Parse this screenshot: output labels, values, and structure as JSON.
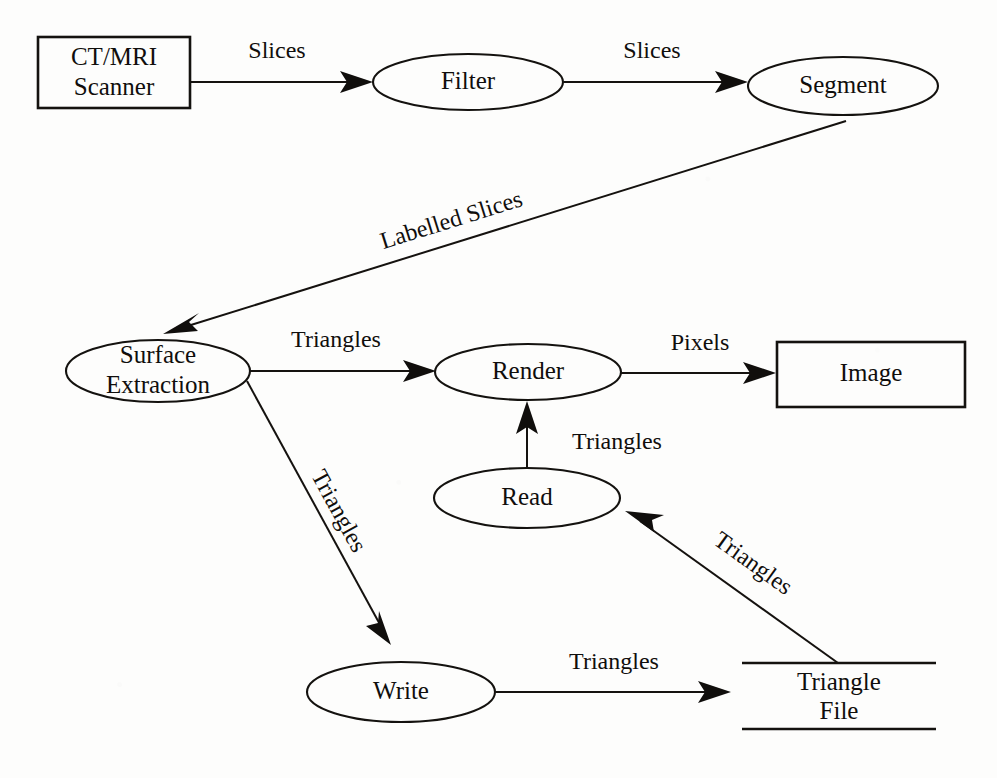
{
  "diagram": {
    "type": "dataflow-diagram",
    "background_color": "#fdfdfc",
    "stroke_color": "#14120f",
    "nodes": [
      {
        "id": "scanner",
        "label_lines": [
          "CT/MRI",
          "Scanner"
        ],
        "line1": "CT/MRI",
        "line2": "Scanner",
        "shape": "rectangle"
      },
      {
        "id": "filter",
        "label_lines": [
          "Filter"
        ],
        "line1": "Filter",
        "shape": "ellipse"
      },
      {
        "id": "segment",
        "label_lines": [
          "Segment"
        ],
        "line1": "Segment",
        "shape": "ellipse"
      },
      {
        "id": "surface-extraction",
        "label_lines": [
          "Surface",
          "Extraction"
        ],
        "line1": "Surface",
        "line2": "Extraction",
        "shape": "ellipse"
      },
      {
        "id": "render",
        "label_lines": [
          "Render"
        ],
        "line1": "Render",
        "shape": "ellipse"
      },
      {
        "id": "image",
        "label_lines": [
          "Image"
        ],
        "line1": "Image",
        "shape": "rectangle"
      },
      {
        "id": "read",
        "label_lines": [
          "Read"
        ],
        "line1": "Read",
        "shape": "ellipse"
      },
      {
        "id": "write",
        "label_lines": [
          "Write"
        ],
        "line1": "Write",
        "shape": "ellipse"
      },
      {
        "id": "triangle-file",
        "label_lines": [
          "Triangle",
          "File"
        ],
        "line1": "Triangle",
        "line2": "File",
        "shape": "data-store"
      }
    ],
    "edges": [
      {
        "id": "scanner-to-filter",
        "from": "scanner",
        "to": "filter",
        "label": "Slices"
      },
      {
        "id": "filter-to-segment",
        "from": "filter",
        "to": "segment",
        "label": "Slices"
      },
      {
        "id": "segment-to-surface",
        "from": "segment",
        "to": "surface-extraction",
        "label": "Labelled Slices"
      },
      {
        "id": "surface-to-render",
        "from": "surface-extraction",
        "to": "render",
        "label": "Triangles"
      },
      {
        "id": "render-to-image",
        "from": "render",
        "to": "image",
        "label": "Pixels"
      },
      {
        "id": "read-to-render",
        "from": "read",
        "to": "render",
        "label": "Triangles"
      },
      {
        "id": "surface-to-write",
        "from": "surface-extraction",
        "to": "write",
        "label": "Triangles"
      },
      {
        "id": "write-to-file",
        "from": "write",
        "to": "triangle-file",
        "label": "Triangles"
      },
      {
        "id": "file-to-read",
        "from": "triangle-file",
        "to": "read",
        "label": "Triangles"
      }
    ]
  }
}
